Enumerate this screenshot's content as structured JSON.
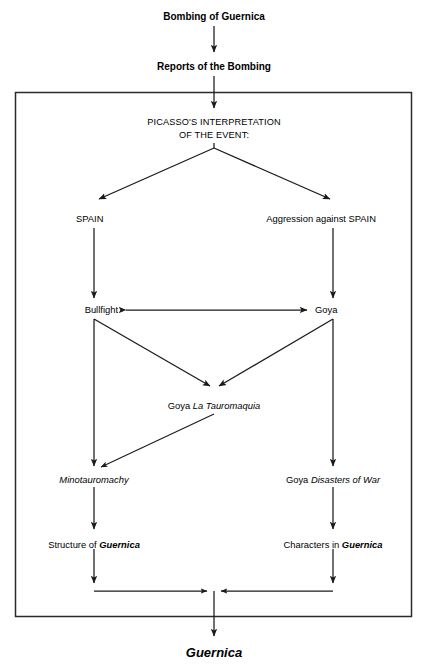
{
  "diagram": {
    "background_color": "#ffffff",
    "line_color": "#1a1a1a",
    "frame_color": "#2b2b2b",
    "nodes": {
      "bombing": {
        "label": "Bombing of Guernica",
        "style": "bold"
      },
      "reports": {
        "label": "Reports of the Bombing",
        "style": "bold"
      },
      "interpretation_line1": {
        "label": "PICASSO'S INTERPRETATION",
        "style": "caps"
      },
      "interpretation_line2": {
        "label": "OF THE EVENT:",
        "style": "caps"
      },
      "spain": {
        "label": "SPAIN",
        "style": "regular"
      },
      "aggression": {
        "label": "Aggression against SPAIN",
        "style": "regular"
      },
      "bullfight": {
        "label": "Bullfight",
        "style": "regular"
      },
      "goya": {
        "label": "Goya",
        "style": "regular"
      },
      "tauromaquia_prefix": {
        "label": "Goya ",
        "style": "regular"
      },
      "tauromaquia_title": {
        "label": "La Tauromaquia",
        "style": "italic"
      },
      "minotauromachy": {
        "label": "Minotauromachy",
        "style": "italic"
      },
      "disasters_prefix": {
        "label": "Goya ",
        "style": "regular"
      },
      "disasters_title": {
        "label": "Disasters of War",
        "style": "italic"
      },
      "structure_prefix": {
        "label": "Structure of ",
        "style": "regular"
      },
      "structure_work": {
        "label": "Guernica",
        "style": "bold-italic"
      },
      "characters_prefix": {
        "label": "Characters in ",
        "style": "regular"
      },
      "characters_work": {
        "label": "Guernica",
        "style": "bold-italic"
      },
      "final": {
        "label": "Guernica",
        "style": "bold-italic"
      }
    },
    "edges": [
      {
        "name": "bombing-to-reports",
        "from": "bombing",
        "to": "reports",
        "kind": "arrow-down"
      },
      {
        "name": "reports-to-interpretation",
        "from": "reports",
        "to": "interpretation",
        "kind": "arrow-down"
      },
      {
        "name": "interpretation-to-spain",
        "from": "interpretation",
        "to": "spain",
        "kind": "arrow-diagonal-left"
      },
      {
        "name": "interpretation-to-aggression",
        "from": "interpretation",
        "to": "aggression",
        "kind": "arrow-diagonal-right"
      },
      {
        "name": "spain-to-bullfight",
        "from": "spain",
        "to": "bullfight",
        "kind": "arrow-down"
      },
      {
        "name": "aggression-to-goya",
        "from": "aggression",
        "to": "goya",
        "kind": "arrow-down"
      },
      {
        "name": "bullfight-goya-bidirectional",
        "from": "bullfight",
        "to": "goya",
        "kind": "arrow-bidirectional"
      },
      {
        "name": "bullfight-to-tauromaquia",
        "from": "bullfight",
        "to": "tauromaquia",
        "kind": "arrow-diagonal-right-down"
      },
      {
        "name": "goya-to-tauromaquia",
        "from": "goya",
        "to": "tauromaquia",
        "kind": "arrow-diagonal-left-down"
      },
      {
        "name": "tauromaquia-to-minotauromachy",
        "from": "tauromaquia",
        "to": "minotauromachy",
        "kind": "arrow-diagonal-left-down"
      },
      {
        "name": "bullfight-to-minotauromachy",
        "from": "bullfight",
        "to": "minotauromachy",
        "kind": "arrow-down"
      },
      {
        "name": "goya-to-disasters",
        "from": "goya",
        "to": "disasters",
        "kind": "arrow-down"
      },
      {
        "name": "minotauromachy-to-structure",
        "from": "minotauromachy",
        "to": "structure",
        "kind": "arrow-down"
      },
      {
        "name": "disasters-to-characters",
        "from": "disasters",
        "to": "characters",
        "kind": "arrow-down"
      },
      {
        "name": "structure-to-merge",
        "from": "structure",
        "to": "merge",
        "kind": "elbow-down-right"
      },
      {
        "name": "characters-to-merge",
        "from": "characters",
        "to": "merge",
        "kind": "elbow-down-left"
      },
      {
        "name": "merge-to-final",
        "from": "merge",
        "to": "final",
        "kind": "arrow-down"
      }
    ]
  }
}
